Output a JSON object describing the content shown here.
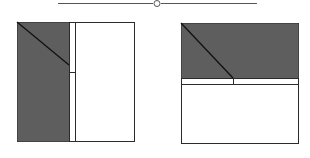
{
  "colors": {
    "pane_fill": "#5e5e5e",
    "border": "#2b2b2b",
    "background": "#ffffff",
    "divider_line": "#3a3a3a"
  },
  "slider": {
    "icon": "circle-handle-icon",
    "line_from_x": 58,
    "line_to_x": 257,
    "handle_x": 157,
    "y": 3
  },
  "figures": [
    {
      "name": "vertical-split-diagram",
      "orientation": "vertical",
      "box": {
        "x": 17,
        "y": 22,
        "w": 117,
        "h": 119
      },
      "filled_pane": {
        "x": 17,
        "y": 22,
        "w": 52,
        "h": 119
      },
      "splitter": {
        "x": 69,
        "y": 22,
        "w": 6,
        "h": 119
      },
      "diagonal": {
        "x1": 17,
        "y1": 22,
        "x2": 69,
        "y2": 65
      },
      "tick": {
        "x1": 69,
        "y1": 72,
        "x2": 75,
        "y2": 72
      }
    },
    {
      "name": "horizontal-split-diagram",
      "orientation": "horizontal",
      "box": {
        "x": 181,
        "y": 23,
        "w": 117,
        "h": 120
      },
      "filled_pane": {
        "x": 181,
        "y": 23,
        "w": 117,
        "h": 55
      },
      "splitter": {
        "x": 181,
        "y": 78,
        "w": 117,
        "h": 6
      },
      "diagonal": {
        "x1": 181,
        "y1": 23,
        "x2": 233,
        "y2": 78
      },
      "tick": {
        "x1": 233,
        "y1": 78,
        "x2": 233,
        "y2": 84
      }
    }
  ]
}
